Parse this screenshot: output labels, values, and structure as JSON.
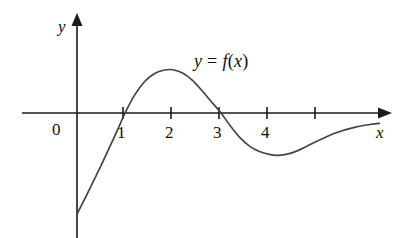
{
  "figure": {
    "background_color": "#ffffff",
    "ink_color": "#1a1a1a",
    "curve_color": "#444444"
  },
  "axes": {
    "x_axis_name": "x",
    "y_axis_name": "y",
    "origin_label": "0",
    "x_tick_labels": [
      "1",
      "2",
      "3",
      "4"
    ],
    "x_tick_values": [
      1,
      2,
      3,
      4,
      5
    ],
    "x_unlabeled_tick_value": 5,
    "y_tick_labels": []
  },
  "annotations": {
    "curve_label": "y = f(x)",
    "curve_label_y": "y",
    "curve_label_eq": "=",
    "curve_label_f": "f",
    "curve_label_paren_open": "(",
    "curve_label_x": "x",
    "curve_label_paren_close": ")"
  },
  "chart_data": {
    "type": "line",
    "title": "",
    "xlabel": "x",
    "ylabel": "y",
    "grid": false,
    "legend": "inline-annotation",
    "series": [
      {
        "name": "y = f(x)",
        "x": [
          0.0,
          0.1,
          0.2,
          0.3,
          0.4,
          0.5,
          0.6,
          0.7,
          0.8,
          0.9,
          1.0,
          1.2,
          1.4,
          1.6,
          1.8,
          2.0,
          2.2,
          2.4,
          2.6,
          2.8,
          3.0,
          3.2,
          3.4,
          3.6,
          3.8,
          4.0,
          4.2,
          4.4,
          4.6,
          4.8,
          5.0,
          5.4,
          5.8,
          6.2,
          6.3
        ],
        "y": [
          -2.15,
          -1.95,
          -1.75,
          -1.54,
          -1.33,
          -1.12,
          -0.9,
          -0.68,
          -0.46,
          -0.23,
          0.0,
          0.38,
          0.66,
          0.83,
          0.91,
          0.92,
          0.85,
          0.7,
          0.48,
          0.24,
          0.0,
          -0.28,
          -0.53,
          -0.71,
          -0.82,
          -0.88,
          -0.9,
          -0.87,
          -0.8,
          -0.7,
          -0.6,
          -0.42,
          -0.3,
          -0.23,
          -0.22
        ]
      }
    ],
    "key_points": {
      "y_intercept": -2.15,
      "zeros": [
        1,
        3
      ],
      "local_maximum": {
        "x": 2.0,
        "y": 0.92
      },
      "local_minimum": {
        "x": 4.2,
        "y": -0.9
      }
    },
    "xlim": [
      -1.15,
      6.4
    ],
    "ylim": [
      -2.6,
      2.0
    ]
  }
}
